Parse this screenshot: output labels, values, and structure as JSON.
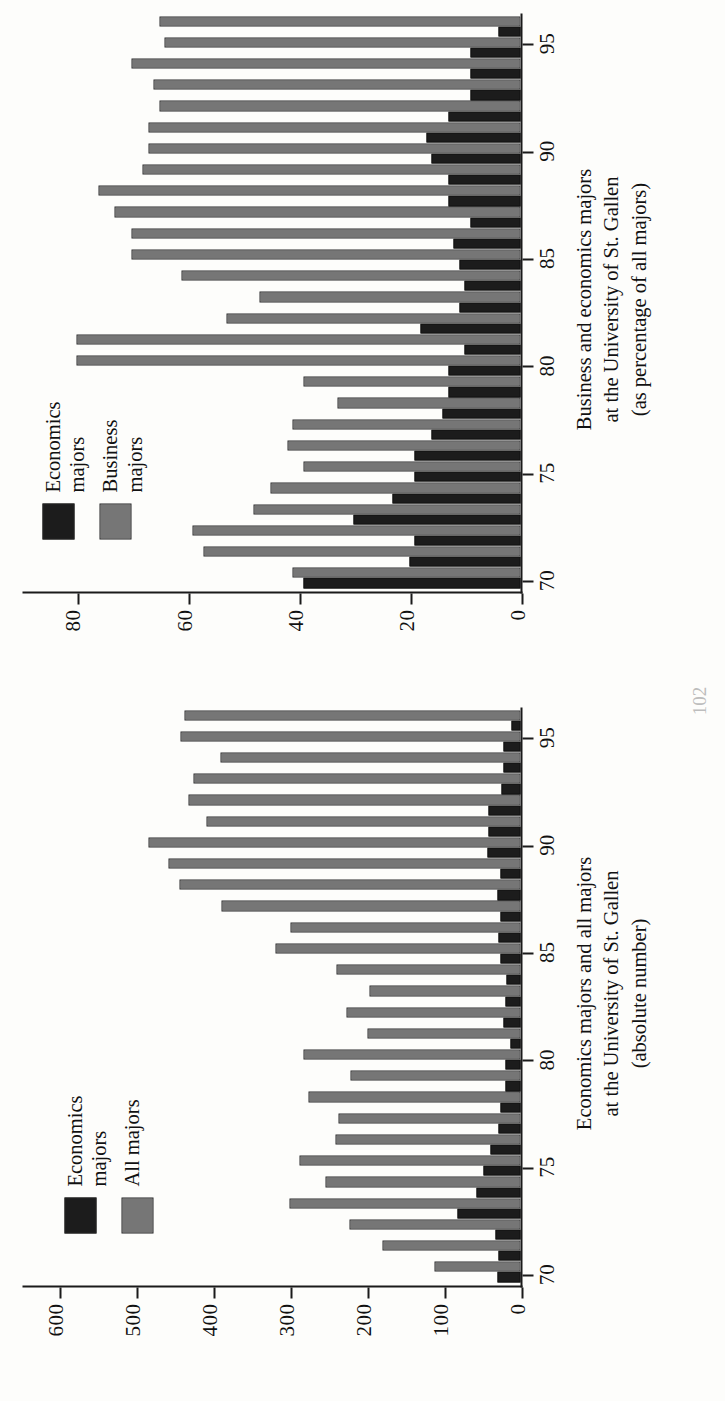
{
  "page": {
    "folio": "102"
  },
  "charts": [
    {
      "id": "absolute",
      "legend": [
        {
          "swatch": "dark",
          "label": "Economics\nmajors"
        },
        {
          "swatch": "light",
          "label": "All majors"
        }
      ],
      "caption_lines": [
        "Economics majors and all majors",
        "at the University of St. Gallen",
        "(absolute number)"
      ],
      "yticks": [
        "0",
        "100",
        "200",
        "300",
        "400",
        "500",
        "600"
      ],
      "xticks": [
        "70",
        "75",
        "80",
        "85",
        "90",
        "95"
      ],
      "chart_data": {
        "type": "bar",
        "title": "Economics majors and all majors at the University of St. Gallen (absolute number)",
        "xlabel": "",
        "ylabel": "",
        "ylim": [
          0,
          650
        ],
        "grid": false,
        "legend_position": "top-left",
        "categories": [
          "70",
          "71",
          "72",
          "73",
          "74",
          "75",
          "76",
          "77",
          "78",
          "79",
          "80",
          "81",
          "82",
          "83",
          "84",
          "85",
          "86",
          "87",
          "88",
          "89",
          "90",
          "91",
          "92",
          "93",
          "94",
          "95",
          "96"
        ],
        "series": [
          {
            "name": "Economics majors",
            "color": "#1c1c1c",
            "values": [
              30,
              28,
              33,
              82,
              57,
              48,
              39,
              28,
              26,
              20,
              19,
              13,
              22,
              20,
              18,
              26,
              28,
              26,
              30,
              26,
              43,
              42,
              42,
              25,
              22,
              22,
              12
            ]
          },
          {
            "name": "All majors",
            "color": "#9a9a9a",
            "values": [
              112,
              180,
              222,
              300,
              253,
              287,
              241,
              236,
              276,
              221,
              282,
              199,
              226,
              196,
              239,
              318,
              299,
              389,
              443,
              458,
              483,
              408,
              432,
              425,
              390,
              442,
              437
            ]
          }
        ]
      }
    },
    {
      "id": "percentage",
      "legend": [
        {
          "swatch": "dark",
          "label": "Economics\nmajors"
        },
        {
          "swatch": "light",
          "label": "Business\nmajors"
        }
      ],
      "caption_lines": [
        "Business and economics majors",
        "at the University of St. Gallen",
        "(as percentage of all majors)"
      ],
      "yticks": [
        "0",
        "20",
        "40",
        "60",
        "80"
      ],
      "xticks": [
        "70",
        "75",
        "80",
        "85",
        "90",
        "95"
      ],
      "chart_data": {
        "type": "bar",
        "title": "Business and economics majors at the University of St. Gallen (as percentage of all majors)",
        "xlabel": "",
        "ylabel": "",
        "ylim": [
          0,
          90
        ],
        "grid": false,
        "legend_position": "top-left",
        "categories": [
          "70",
          "71",
          "72",
          "73",
          "74",
          "75",
          "76",
          "77",
          "78",
          "79",
          "80",
          "81",
          "82",
          "83",
          "84",
          "85",
          "86",
          "87",
          "88",
          "89",
          "90",
          "91",
          "92",
          "93",
          "94",
          "95",
          "96"
        ],
        "series": [
          {
            "name": "Economics majors",
            "color": "#1c1c1c",
            "values": [
              39,
              20,
              19,
              30,
              23,
              19,
              19,
              16,
              14,
              13,
              13,
              10,
              18,
              11,
              10,
              11,
              12,
              9,
              13,
              13,
              16,
              17,
              13,
              9,
              9,
              9,
              4
            ]
          },
          {
            "name": "Business majors",
            "color": "#9a9a9a",
            "values": [
              41,
              57,
              59,
              48,
              45,
              39,
              42,
              41,
              33,
              39,
              80,
              80,
              53,
              47,
              61,
              70,
              70,
              73,
              76,
              68,
              67,
              67,
              65,
              66,
              70,
              64,
              65
            ]
          }
        ]
      }
    }
  ]
}
